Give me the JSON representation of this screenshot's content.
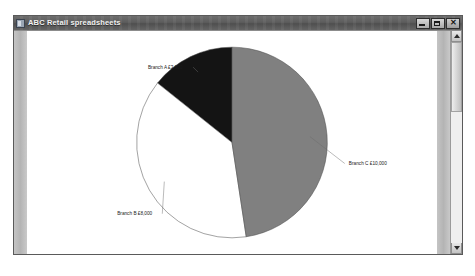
{
  "window": {
    "title": "ABC Retail spreadsheets",
    "icon": "spreadsheet-icon",
    "controls": {
      "minimize_label": "_",
      "maximize_label": "□",
      "close_label": "✕"
    }
  },
  "scrollbar": {
    "up_arrow": "▲",
    "down_arrow": "▼"
  },
  "chart_data": {
    "type": "pie",
    "title": "",
    "currency_symbol": "£",
    "categories": [
      "Branch A",
      "Branch B",
      "Branch C"
    ],
    "values": [
      3000,
      8000,
      10000
    ],
    "total": 21000,
    "labels": [
      "Branch A £3,000",
      "Branch B £8,000",
      "Branch C £10,000"
    ],
    "colors": [
      "#141414",
      "#ffffff",
      "#808080"
    ],
    "slices": [
      {
        "name": "Branch A",
        "label": "Branch A £3,000",
        "value": 3000,
        "color": "#141414",
        "start_angle": 308.6,
        "end_angle": 360.0,
        "percent": 14.3,
        "label_x": 117,
        "label_y": 33
      },
      {
        "name": "Branch B",
        "label": "Branch B £8,000",
        "value": 8000,
        "color": "#ffffff",
        "start_angle": 171.4,
        "end_angle": 308.6,
        "percent": 38.1,
        "label_x": 87,
        "label_y": 176
      },
      {
        "name": "Branch C",
        "label": "Branch C £10,000",
        "value": 10000,
        "color": "#808080",
        "start_angle": 0.0,
        "end_angle": 171.4,
        "percent": 47.6,
        "label_x": 313,
        "label_y": 127
      }
    ],
    "legend_position": "none",
    "grid": false,
    "xlabel": "",
    "ylabel": ""
  }
}
